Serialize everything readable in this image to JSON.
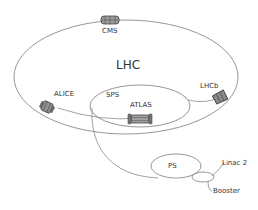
{
  "diagram": {
    "title": "LHC",
    "rings": [
      {
        "id": "lhc",
        "label": "LHC"
      },
      {
        "id": "sps",
        "label": "SPS"
      },
      {
        "id": "ps",
        "label": "PS"
      },
      {
        "id": "booster",
        "label": "Booster"
      },
      {
        "id": "linac2",
        "label": "Linac 2"
      }
    ],
    "experiments": [
      {
        "id": "cms",
        "label": "CMS",
        "icon": "cms-detector-icon"
      },
      {
        "id": "alice",
        "label": "ALICE",
        "icon": "alice-detector-icon"
      },
      {
        "id": "lhcb",
        "label": "LHCb",
        "icon": "lhcb-detector-icon"
      },
      {
        "id": "atlas",
        "label": "ATLAS",
        "icon": "atlas-detector-icon"
      }
    ],
    "colors": {
      "line": "#8a8a8a",
      "text": "#333333",
      "detector_fill": "#9a9a9a",
      "detector_stroke": "#444444"
    }
  }
}
